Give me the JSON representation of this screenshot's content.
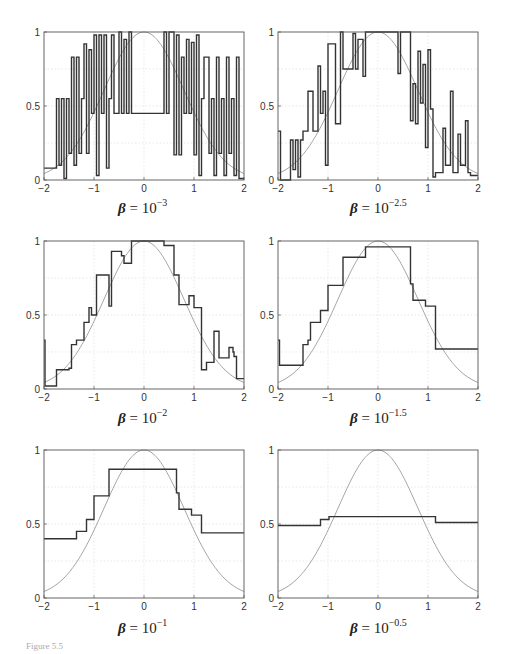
{
  "figure": {
    "figure_label": "Figure 5.5",
    "layout": {
      "rows": 3,
      "cols": 2
    },
    "reference_curve": {
      "type": "gaussian",
      "formula": "exp(-x^2/(2*0.8^2))",
      "color": "#9a9a9a"
    },
    "step_color": "#333333"
  },
  "chart_data": [
    {
      "type": "line",
      "title": "β = 10^-3",
      "caption_base": "β = 10",
      "caption_exp": "−3",
      "xlabel": "",
      "ylabel": "",
      "xlim": [
        -2,
        2
      ],
      "ylim": [
        0,
        1
      ],
      "xticks": [
        "−2",
        "−1",
        "0",
        "1",
        "2"
      ],
      "yticks": [
        "0",
        "0.5",
        "1"
      ],
      "grid": true,
      "series": [
        {
          "name": "estimate (noisy steps)",
          "style": "step",
          "x": [
            -2.0,
            -1.75,
            -1.7,
            -1.65,
            -1.6,
            -1.55,
            -1.5,
            -1.45,
            -1.4,
            -1.35,
            -1.3,
            -1.25,
            -1.2,
            -1.15,
            -1.1,
            -1.05,
            -1.0,
            -0.95,
            -0.9,
            -0.85,
            -0.8,
            -0.75,
            -0.7,
            -0.65,
            -0.6,
            -0.5,
            -0.45,
            -0.4,
            -0.35,
            -0.3,
            -0.25,
            0.4,
            0.45,
            0.5,
            0.6,
            0.65,
            0.7,
            0.75,
            0.8,
            0.85,
            0.9,
            0.95,
            1.0,
            1.05,
            1.1,
            1.15,
            1.2,
            1.3,
            1.35,
            1.4,
            1.45,
            1.5,
            1.55,
            1.6,
            1.65,
            1.7,
            1.75,
            1.8,
            1.85,
            1.9,
            2.0
          ],
          "y": [
            0.08,
            0.55,
            0.1,
            0.55,
            0.01,
            0.55,
            0.18,
            0.83,
            0.1,
            0.83,
            0.18,
            0.55,
            0.92,
            0.18,
            0.88,
            0.45,
            0.98,
            0.03,
            0.98,
            0.45,
            0.98,
            0.08,
            0.55,
            0.98,
            0.45,
            1.0,
            0.45,
            0.95,
            0.45,
            1.0,
            0.45,
            1.0,
            0.45,
            1.0,
            0.17,
            0.98,
            0.17,
            0.83,
            0.45,
            0.95,
            0.45,
            0.93,
            0.17,
            0.98,
            0.03,
            0.55,
            0.83,
            0.18,
            0.55,
            0.03,
            0.83,
            0.18,
            0.55,
            0.03,
            0.83,
            0.18,
            0.55,
            0.03,
            0.83,
            0.01,
            0.01
          ]
        },
        {
          "name": "true function",
          "style": "smooth",
          "function": "gaussian",
          "sigma": 0.8
        }
      ]
    },
    {
      "type": "line",
      "title": "β = 10^-2.5",
      "caption_base": "β = 10",
      "caption_exp": "−2.5",
      "xlim": [
        -2,
        2
      ],
      "ylim": [
        0,
        1
      ],
      "xticks": [
        "−2",
        "−1",
        "0",
        "1",
        "2"
      ],
      "yticks": [
        "0",
        "0.5",
        "1"
      ],
      "grid": true,
      "series": [
        {
          "name": "estimate (noisy steps)",
          "style": "step",
          "x": [
            -2.0,
            -1.95,
            -1.75,
            -1.7,
            -1.65,
            -1.6,
            -1.55,
            -1.5,
            -1.4,
            -1.3,
            -1.2,
            -1.15,
            -1.1,
            -1.05,
            -1.0,
            -0.95,
            -0.85,
            -0.75,
            -0.7,
            -0.5,
            -0.45,
            -0.4,
            -0.3,
            -0.25,
            0.4,
            0.45,
            0.65,
            0.7,
            0.75,
            0.8,
            0.85,
            0.9,
            0.95,
            1.0,
            1.05,
            1.1,
            1.15,
            1.3,
            1.35,
            1.45,
            1.5,
            1.6,
            1.65,
            1.75,
            1.8,
            1.85,
            2.0
          ],
          "y": [
            0.33,
            0.0,
            0.27,
            0.07,
            0.27,
            0.02,
            0.27,
            0.33,
            0.6,
            0.33,
            0.77,
            0.45,
            0.6,
            0.1,
            0.92,
            0.92,
            0.38,
            1.0,
            0.75,
            0.99,
            0.75,
            0.95,
            0.7,
            1.0,
            0.72,
            1.0,
            0.4,
            0.65,
            0.38,
            0.87,
            0.52,
            0.78,
            0.22,
            0.88,
            0.48,
            0.02,
            0.05,
            0.35,
            0.1,
            0.6,
            0.05,
            0.31,
            0.1,
            0.4,
            0.05,
            0.03,
            0.03
          ]
        },
        {
          "name": "true function",
          "style": "smooth",
          "function": "gaussian",
          "sigma": 0.8
        }
      ]
    },
    {
      "type": "line",
      "title": "β = 10^-2",
      "caption_base": "β = 10",
      "caption_exp": "−2",
      "xlim": [
        -2,
        2
      ],
      "ylim": [
        0,
        1
      ],
      "xticks": [
        "−2",
        "−1",
        "0",
        "1",
        "2"
      ],
      "yticks": [
        "0",
        "0.5",
        "1"
      ],
      "grid": true,
      "series": [
        {
          "name": "estimate (steps)",
          "style": "step",
          "x": [
            -2.0,
            -1.98,
            -1.75,
            -1.5,
            -1.45,
            -1.35,
            -1.2,
            -1.1,
            -1.05,
            -0.95,
            -0.75,
            -0.7,
            -0.65,
            -0.45,
            -0.4,
            -0.25,
            -0.2,
            0.4,
            0.45,
            0.6,
            0.65,
            0.7,
            0.85,
            0.9,
            1.0,
            1.15,
            1.25,
            1.4,
            1.5,
            1.7,
            1.78,
            1.8,
            1.85,
            1.9,
            2.0
          ],
          "y": [
            0.33,
            0.02,
            0.13,
            0.14,
            0.3,
            0.33,
            0.45,
            0.55,
            0.5,
            0.77,
            0.77,
            0.56,
            0.93,
            0.9,
            0.85,
            1.0,
            1.0,
            0.97,
            0.97,
            0.77,
            0.77,
            0.57,
            0.57,
            0.63,
            0.55,
            0.13,
            0.18,
            0.39,
            0.21,
            0.28,
            0.25,
            0.22,
            0.07,
            0.07,
            0.07
          ]
        },
        {
          "name": "true function",
          "style": "smooth",
          "function": "gaussian",
          "sigma": 0.8
        }
      ]
    },
    {
      "type": "line",
      "title": "β = 10^-1.5",
      "caption_base": "β = 10",
      "caption_exp": "−1.5",
      "xlim": [
        -2,
        2
      ],
      "ylim": [
        0,
        1
      ],
      "xticks": [
        "−2",
        "−1",
        "0",
        "1",
        "2"
      ],
      "yticks": [
        "0",
        "0.5",
        "1"
      ],
      "grid": true,
      "series": [
        {
          "name": "estimate (steps)",
          "style": "step",
          "x": [
            -2.0,
            -1.97,
            -1.5,
            -1.4,
            -1.35,
            -1.3,
            -1.15,
            -1.0,
            -0.7,
            -0.25,
            0.65,
            0.7,
            0.8,
            0.95,
            1.15,
            2.0
          ],
          "y": [
            0.33,
            0.16,
            0.3,
            0.33,
            0.45,
            0.45,
            0.53,
            0.7,
            0.89,
            0.96,
            0.71,
            0.6,
            0.6,
            0.56,
            0.27,
            0.27
          ]
        },
        {
          "name": "true function",
          "style": "smooth",
          "function": "gaussian",
          "sigma": 0.8
        }
      ]
    },
    {
      "type": "line",
      "title": "β = 10^-1",
      "caption_base": "β = 10",
      "caption_exp": "−1",
      "xlim": [
        -2,
        2
      ],
      "ylim": [
        0,
        1
      ],
      "xticks": [
        "−2",
        "−1",
        "0",
        "1",
        "2"
      ],
      "yticks": [
        "0",
        "0.5",
        "1"
      ],
      "grid": true,
      "series": [
        {
          "name": "estimate (steps)",
          "style": "step",
          "x": [
            -2.0,
            -1.35,
            -1.15,
            -1.0,
            -0.7,
            -0.5,
            0.65,
            0.7,
            0.95,
            1.15,
            2.0
          ],
          "y": [
            0.4,
            0.45,
            0.53,
            0.69,
            0.87,
            0.87,
            0.71,
            0.6,
            0.56,
            0.44,
            0.44
          ]
        },
        {
          "name": "true function",
          "style": "smooth",
          "function": "gaussian",
          "sigma": 0.8
        }
      ]
    },
    {
      "type": "line",
      "title": "β = 10^-0.5",
      "caption_base": "β = 10",
      "caption_exp": "−0.5",
      "xlim": [
        -2,
        2
      ],
      "ylim": [
        0,
        1
      ],
      "xticks": [
        "−2",
        "−1",
        "0",
        "1",
        "2"
      ],
      "yticks": [
        "0",
        "0.5",
        "1"
      ],
      "grid": true,
      "series": [
        {
          "name": "estimate (steps)",
          "style": "step",
          "x": [
            -2.0,
            -1.15,
            -0.98,
            1.15,
            2.0
          ],
          "y": [
            0.49,
            0.53,
            0.55,
            0.51,
            0.51
          ]
        },
        {
          "name": "true function",
          "style": "smooth",
          "function": "gaussian",
          "sigma": 0.8
        }
      ]
    }
  ]
}
